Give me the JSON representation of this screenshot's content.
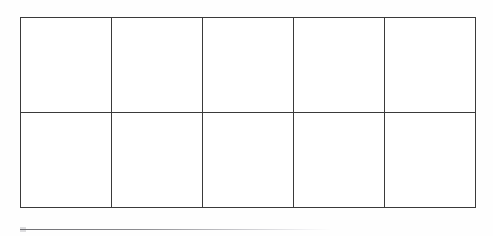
{
  "document": {
    "kind": "ten-frame-worksheet",
    "title": "Ten Frame",
    "page_background": "#fefefe"
  },
  "grid": {
    "label": "Ten frame",
    "rows": 2,
    "columns": 5,
    "total_cells": 10,
    "filled_count": 0,
    "line_color": "#3a3a3a",
    "cell_fill_color": "#ffffff",
    "cells": [
      {
        "index": 1,
        "row": 1,
        "column": 1,
        "filled": false,
        "value": ""
      },
      {
        "index": 2,
        "row": 1,
        "column": 2,
        "filled": false,
        "value": ""
      },
      {
        "index": 3,
        "row": 1,
        "column": 3,
        "filled": false,
        "value": ""
      },
      {
        "index": 4,
        "row": 1,
        "column": 4,
        "filled": false,
        "value": ""
      },
      {
        "index": 5,
        "row": 1,
        "column": 5,
        "filled": false,
        "value": ""
      },
      {
        "index": 6,
        "row": 2,
        "column": 1,
        "filled": false,
        "value": ""
      },
      {
        "index": 7,
        "row": 2,
        "column": 2,
        "filled": false,
        "value": ""
      },
      {
        "index": 8,
        "row": 2,
        "column": 3,
        "filled": false,
        "value": ""
      },
      {
        "index": 9,
        "row": 2,
        "column": 4,
        "filled": false,
        "value": ""
      },
      {
        "index": 10,
        "row": 2,
        "column": 5,
        "filled": false,
        "value": ""
      }
    ]
  },
  "baseline_rule": {
    "label": "answer line",
    "color": "#8c8c90",
    "text": ""
  }
}
